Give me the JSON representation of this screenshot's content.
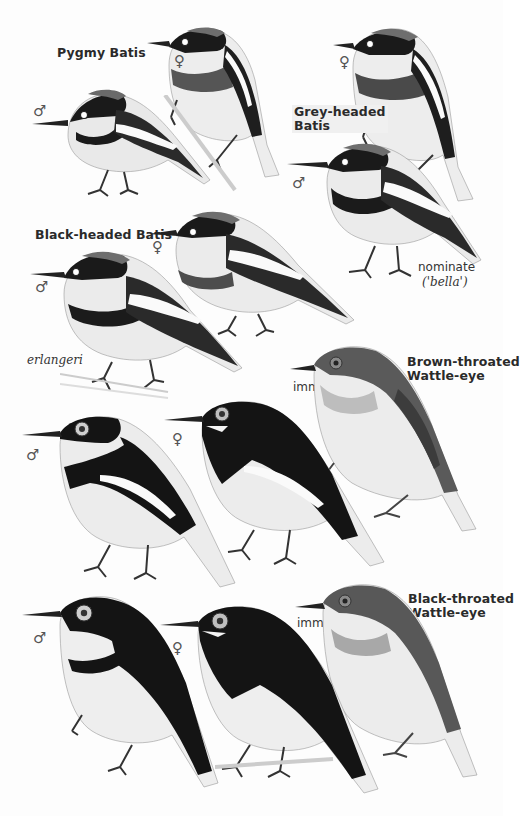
{
  "plate": {
    "species": [
      {
        "name": "Pygmy Batis",
        "figures": [
          {
            "sex": "♂",
            "sex_name": "male"
          },
          {
            "sex": "♀",
            "sex_name": "female"
          }
        ]
      },
      {
        "name_lines": [
          "Grey-headed",
          "Batis"
        ],
        "figures": [
          {
            "sex": "♀",
            "sex_name": "female"
          },
          {
            "sex": "♂",
            "sex_name": "male"
          }
        ],
        "note_lines": [
          "nominate",
          "('bella')"
        ]
      },
      {
        "name": "Black-headed Batis",
        "figures": [
          {
            "sex": "♂",
            "sex_name": "male"
          },
          {
            "sex": "♀",
            "sex_name": "female"
          }
        ],
        "subspecies": "erlangeri"
      },
      {
        "name_lines": [
          "Brown-throated",
          "Wattle-eye"
        ],
        "figures": [
          {
            "sex": "♂",
            "sex_name": "male"
          },
          {
            "sex": "♀",
            "sex_name": "female"
          },
          {
            "age": "imm"
          }
        ]
      },
      {
        "name_lines": [
          "Black-throated",
          "Wattle-eye"
        ],
        "figures": [
          {
            "sex": "♂",
            "sex_name": "male"
          },
          {
            "sex": "♀",
            "sex_name": "female"
          },
          {
            "age": "imm"
          }
        ]
      }
    ]
  },
  "labels": {
    "pygmy_batis": "Pygmy Batis",
    "grey_headed_1": "Grey-headed",
    "grey_headed_2": "Batis",
    "nominate": "nominate",
    "bella": "('bella')",
    "black_headed_batis": "Black-headed Batis",
    "erlangeri": "erlangeri",
    "brown_throated_1": "Brown-throated",
    "brown_throated_2": "Wattle-eye",
    "black_throated_1": "Black-throated",
    "black_throated_2": "Wattle-eye",
    "imm": "imm",
    "male": "♂",
    "female": "♀"
  },
  "colors": {
    "black": "#111111",
    "grey_head": "#555555",
    "band_grey": "#4a4a4a",
    "white": "#f7f7f7",
    "label": "#2a2a2a"
  }
}
